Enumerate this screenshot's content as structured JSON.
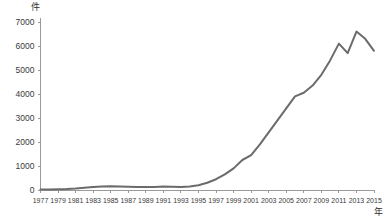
{
  "chart_data": {
    "type": "line",
    "title": "",
    "subtitle": "",
    "xlabel": "年",
    "ylabel": "件",
    "xlim": [
      1977,
      2015
    ],
    "ylim": [
      0,
      7000
    ],
    "grid": false,
    "legend": false,
    "legend_position": "none",
    "line_color": "#6b6b6b",
    "line_width": 2,
    "y_ticks": [
      0,
      1000,
      2000,
      3000,
      4000,
      5000,
      6000,
      7000
    ],
    "y_tick_labels": [
      "0",
      "1000",
      "2000",
      "3000",
      "4000",
      "5000",
      "6000",
      "7000"
    ],
    "x_ticks": [
      1977,
      1979,
      1981,
      1983,
      1985,
      1987,
      1989,
      1991,
      1993,
      1995,
      1997,
      1999,
      2001,
      2003,
      2005,
      2007,
      2009,
      2011,
      2013,
      2015
    ],
    "x_tick_labels": [
      "1977",
      "1979",
      "1981",
      "1983",
      "1985",
      "1987",
      "1989",
      "1991",
      "1993",
      "1995",
      "1997",
      "1999",
      "2001",
      "2003",
      "2005",
      "2007",
      "2009",
      "2011",
      "2013",
      "2015"
    ],
    "x": [
      1977,
      1978,
      1979,
      1980,
      1981,
      1982,
      1983,
      1984,
      1985,
      1986,
      1987,
      1988,
      1989,
      1990,
      1991,
      1992,
      1993,
      1994,
      1995,
      1996,
      1997,
      1998,
      1999,
      2000,
      2001,
      2002,
      2003,
      2004,
      2005,
      2006,
      2007,
      2008,
      2009,
      2010,
      2011,
      2012,
      2013,
      2014,
      2015
    ],
    "values": [
      20,
      25,
      30,
      40,
      60,
      90,
      120,
      150,
      160,
      150,
      140,
      130,
      120,
      130,
      150,
      140,
      130,
      150,
      200,
      300,
      450,
      650,
      900,
      1250,
      1450,
      1900,
      2400,
      2900,
      3400,
      3900,
      4050,
      4350,
      4800,
      5400,
      6100,
      5700,
      6600,
      6300,
      5800
    ]
  },
  "axes": {
    "y_unit": "件",
    "x_unit": "年"
  }
}
